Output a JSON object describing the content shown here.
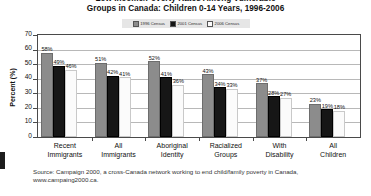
{
  "chart_data": {
    "type": "bar",
    "title": "Groups in Canada: Children 0-14 Years, 1996-2006",
    "title_line1": "Low Income/Poverty Rates Among Vulnerable",
    "title_line2": "Groups in Canada: Children 0-14 Years, 1996-2006",
    "xlabel": "",
    "ylabel": "Percent (%)",
    "ylim": [
      0,
      70
    ],
    "yticks": [
      0,
      10,
      20,
      30,
      40,
      50,
      60,
      70
    ],
    "ytick_labels": [
      "0",
      "10",
      "20",
      "30",
      "40",
      "50",
      "60",
      "70"
    ],
    "grid": true,
    "legend_position": "top-center",
    "categories": [
      "Recent Immigrants",
      "All Immigrants",
      "Aboriginal Identity",
      "Racialized Groups",
      "With Disability",
      "All Children"
    ],
    "category_lines": [
      [
        "Recent",
        "Immigrants"
      ],
      [
        "All",
        "Immigrants"
      ],
      [
        "Aboriginal",
        "Identity"
      ],
      [
        "Racialized",
        "Groups"
      ],
      [
        "With",
        "Disability"
      ],
      [
        "All",
        "Children"
      ]
    ],
    "series": [
      {
        "name": "1996 Census",
        "color": "#8c8c8c",
        "values": [
          58,
          51,
          52,
          43,
          37,
          23
        ],
        "labels": [
          "58%",
          "51%",
          "52%",
          "43%",
          "37%",
          "23%"
        ]
      },
      {
        "name": "2001 Census",
        "color": "#161616",
        "values": [
          49,
          42,
          41,
          34,
          28,
          19
        ],
        "labels": [
          "49%",
          "42%",
          "41%",
          "34%",
          "28%",
          "19%"
        ]
      },
      {
        "name": "2006 Census",
        "color": "#fbfbfb",
        "values": [
          46,
          41,
          36,
          33,
          27,
          18
        ],
        "labels": [
          "46%",
          "41%",
          "36%",
          "33%",
          "27%",
          "18%"
        ]
      }
    ]
  },
  "source": {
    "line1": "Source: Campaign 2000, a cross-Canada network working to end child/family poverty in Canada,",
    "line2": "www.campaing2000.ca."
  }
}
